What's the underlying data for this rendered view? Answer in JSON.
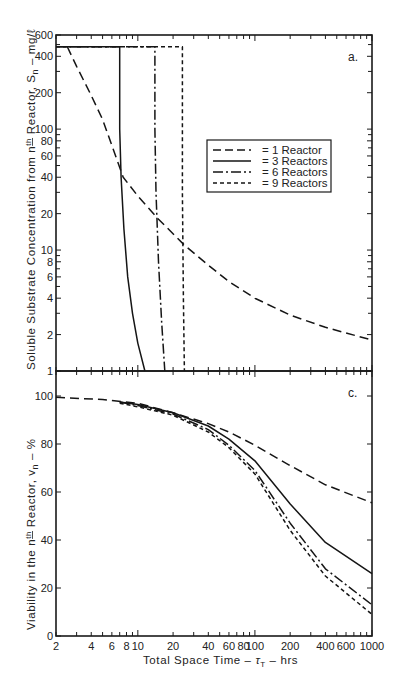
{
  "chart_data": [
    {
      "panel": "a.",
      "type": "line",
      "title": "",
      "xlabel": "Total Space Time - τT - hrs",
      "ylabel": "Soluble Substrate Concentration from nth Reactor, Sn - mg/ℓ",
      "xscale": "log",
      "yscale": "log",
      "xlim": [
        2,
        1000
      ],
      "ylim": [
        1,
        600
      ],
      "yticks": [
        1,
        2,
        4,
        6,
        8,
        10,
        20,
        40,
        60,
        80,
        100,
        200,
        400,
        600
      ],
      "ytick_labels": [
        "1",
        "2",
        "4",
        "6",
        "8",
        "10",
        "20",
        "40",
        "60",
        "80",
        "100",
        "200",
        "400",
        "600"
      ],
      "grid": false,
      "legend_position": "right-center",
      "series": [
        {
          "name": "1 Reactor",
          "style": "long-dash",
          "x": [
            2.5,
            3,
            4,
            5,
            7.5,
            10,
            15,
            25,
            40,
            60,
            100,
            200,
            400,
            1000
          ],
          "y": [
            480,
            330,
            190,
            120,
            40,
            28,
            18,
            11,
            7.5,
            5.5,
            4,
            2.9,
            2.3,
            1.8
          ]
        },
        {
          "name": "3 Reactors",
          "style": "solid",
          "x": [
            2,
            7,
            7,
            7.2,
            7.6,
            8.2,
            9,
            10,
            11.5
          ],
          "y": [
            480,
            480,
            100,
            40,
            15,
            6,
            3,
            1.7,
            1
          ]
        },
        {
          "name": "6 Reactors",
          "style": "dash-dot",
          "x": [
            2,
            14,
            14,
            14.3,
            15,
            16,
            17
          ],
          "y": [
            480,
            480,
            100,
            30,
            8,
            2.5,
            1
          ]
        },
        {
          "name": "9 Reactors",
          "style": "short-dash",
          "x": [
            2,
            24,
            24,
            24.5,
            25
          ],
          "y": [
            480,
            480,
            30,
            4,
            1
          ]
        }
      ]
    },
    {
      "panel": "c.",
      "type": "line",
      "title": "",
      "xlabel": "Total Space Time - τT - hrs",
      "ylabel": "Viability in the nth Reactor, vn - %",
      "xscale": "log",
      "yscale": "linear",
      "xlim": [
        2,
        1000
      ],
      "ylim": [
        0,
        100
      ],
      "xticks": [
        2,
        4,
        6,
        8,
        10,
        20,
        40,
        60,
        80,
        100,
        200,
        400,
        600,
        1000
      ],
      "xtick_labels": [
        "2",
        "4",
        "6",
        "8",
        "10",
        "20",
        "40",
        "60",
        "80",
        "100",
        "200",
        "400",
        "600",
        "1000"
      ],
      "yticks": [
        0,
        20,
        40,
        60,
        80,
        100
      ],
      "ytick_labels": [
        "0",
        "20",
        "40",
        "60",
        "80",
        "100"
      ],
      "grid": false,
      "series": [
        {
          "name": "1 Reactor",
          "style": "long-dash",
          "x": [
            2,
            5,
            10,
            20,
            40,
            60,
            100,
            200,
            400,
            1000
          ],
          "y": [
            99.5,
            98.5,
            97,
            93,
            88.5,
            85,
            79.5,
            71,
            63,
            55.5
          ]
        },
        {
          "name": "3 Reactors",
          "style": "solid",
          "x": [
            7,
            10,
            20,
            40,
            60,
            100,
            200,
            400,
            1000
          ],
          "y": [
            97.5,
            96.5,
            93,
            87.5,
            82,
            73,
            55,
            39,
            26
          ]
        },
        {
          "name": "6 Reactors",
          "style": "dash-dot",
          "x": [
            7,
            10,
            20,
            40,
            60,
            100,
            200,
            400,
            1000
          ],
          "y": [
            97.5,
            96,
            92.5,
            86,
            79.5,
            69,
            47,
            28,
            13
          ]
        },
        {
          "name": "9 Reactors",
          "style": "short-dash",
          "x": [
            7,
            10,
            20,
            40,
            60,
            100,
            200,
            400,
            1000
          ],
          "y": [
            97,
            95.5,
            92,
            85,
            78.5,
            67.5,
            44,
            25,
            9
          ]
        }
      ]
    }
  ],
  "labels": {
    "panel_a": "a.",
    "panel_c": "c.",
    "y_title_top": "Soluble Substrate Concentration from n",
    "y_title_top_sup": "th",
    "y_title_top_tail": " Reactor, S",
    "y_title_top_sub": "n",
    "y_title_top_units": " – mg/ℓ",
    "y_title_bottom": "Viability in the n",
    "y_title_bottom_sup": "th",
    "y_title_bottom_tail": " Reactor, v",
    "y_title_bottom_sub": "n",
    "y_title_bottom_units": " – %",
    "x_title": "Total Space Time – ",
    "x_title_tau": "τ",
    "x_title_sub": "T",
    "x_title_units": " – hrs"
  },
  "legend": {
    "items": [
      {
        "label": "= 1 Reactor",
        "style": "long-dash"
      },
      {
        "label": "= 3 Reactors",
        "style": "solid"
      },
      {
        "label": "= 6 Reactors",
        "style": "dash-dot"
      },
      {
        "label": "= 9 Reactors",
        "style": "short-dash"
      }
    ]
  }
}
